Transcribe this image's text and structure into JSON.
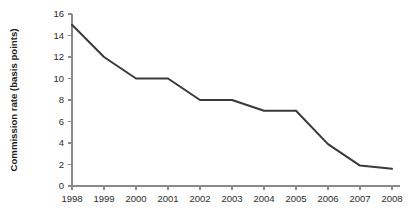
{
  "chart_data": {
    "type": "line",
    "title": "",
    "subtitle": "",
    "xlabel": "",
    "ylabel": "Commission rate (basis points)",
    "x": [
      1998,
      1999,
      2000,
      2001,
      2002,
      2003,
      2004,
      2005,
      2006,
      2007,
      2008
    ],
    "categories": [
      "1998",
      "1999",
      "2000",
      "2001",
      "2002",
      "2003",
      "2004",
      "2005",
      "2006",
      "2007",
      "2008"
    ],
    "values": [
      15,
      12,
      10,
      10,
      8,
      8,
      7,
      7,
      3.9,
      1.9,
      1.6
    ],
    "series": [
      {
        "name": "Commission rate",
        "values": [
          15,
          12,
          10,
          10,
          8,
          8,
          7,
          7,
          3.9,
          1.9,
          1.6
        ]
      }
    ],
    "ylim": [
      0,
      16
    ],
    "xlim": [
      1998,
      2008
    ],
    "yticks": [
      0,
      2,
      4,
      6,
      8,
      10,
      12,
      14,
      16
    ],
    "ytick_labels": [
      "0",
      "2",
      "4",
      "6",
      "8",
      "10",
      "12",
      "14",
      "16"
    ],
    "xticks": [
      1998,
      1999,
      2000,
      2001,
      2002,
      2003,
      2004,
      2005,
      2006,
      2007,
      2008
    ],
    "xtick_labels": [
      "1998",
      "1999",
      "2000",
      "2001",
      "2002",
      "2003",
      "2004",
      "2005",
      "2006",
      "2007",
      "2008"
    ],
    "grid": false,
    "legend": false,
    "legend_position": "none",
    "annotations": [],
    "line_color": "#3a3a3a",
    "axis_color": "#8a8a8a",
    "background_color": "#ffffff"
  }
}
